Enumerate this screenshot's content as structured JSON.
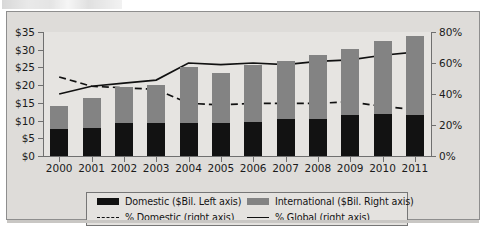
{
  "chart_data": {
    "type": "bar",
    "title": "",
    "subtitle": "",
    "xlabel": "",
    "ylabel": "",
    "categories": [
      "2000",
      "2001",
      "2002",
      "2003",
      "2004",
      "2005",
      "2006",
      "2007",
      "2008",
      "2009",
      "2010",
      "2011"
    ],
    "left_axis": {
      "label": "$Bil.",
      "ticks": [
        "$0",
        "$5",
        "$10",
        "$15",
        "$20",
        "$25",
        "$30",
        "$35"
      ],
      "tick_values": [
        0,
        5,
        10,
        15,
        20,
        25,
        30,
        35
      ],
      "ylim": [
        0,
        35
      ]
    },
    "right_axis": {
      "label": "%",
      "ticks": [
        "0%",
        "20%",
        "40%",
        "60%",
        "80%"
      ],
      "tick_values": [
        0,
        20,
        40,
        60,
        80
      ],
      "ylim": [
        0,
        80
      ]
    },
    "grid": false,
    "legend_position": "bottom",
    "stacked": true,
    "series": [
      {
        "name": "Domestic ($Bil. Left axis)",
        "type": "bar",
        "axis": "left",
        "color": "#121212",
        "values": [
          7.6,
          8.0,
          9.3,
          9.2,
          9.4,
          9.2,
          9.7,
          10.4,
          10.5,
          11.5,
          11.8,
          11.5
        ]
      },
      {
        "name": "International ($Bil. Right axis)",
        "type": "bar",
        "axis": "left",
        "color": "#838383",
        "values": [
          6.5,
          8.5,
          10.3,
          10.8,
          15.6,
          14.2,
          16.1,
          16.3,
          18.0,
          18.6,
          20.7,
          22.4
        ]
      },
      {
        "name": "% Domestic (right axis)",
        "type": "line",
        "style": "dashed",
        "axis": "right",
        "color": "#111111",
        "values": [
          51,
          45,
          44,
          43,
          34,
          33,
          34,
          34,
          34,
          35,
          32,
          30
        ]
      },
      {
        "name": "% Global (right axis)",
        "type": "line",
        "style": "solid",
        "axis": "right",
        "color": "#111111",
        "values": [
          40,
          45,
          47,
          49,
          60,
          59,
          60,
          59,
          61,
          62,
          65,
          67
        ]
      }
    ],
    "totals": [
      14.1,
      16.5,
      19.6,
      20.0,
      25.0,
      23.4,
      25.8,
      26.7,
      28.5,
      30.1,
      32.5,
      33.9
    ]
  },
  "legend": {
    "items": [
      {
        "label": "Domestic ($Bil. Left axis)",
        "marker": "black-swatch"
      },
      {
        "label": "International ($Bil. Right axis)",
        "marker": "gray-swatch"
      },
      {
        "label": "% Domestic (right axis)",
        "marker": "dashed-line"
      },
      {
        "label": "% Global (right axis)",
        "marker": "solid-line"
      }
    ]
  }
}
